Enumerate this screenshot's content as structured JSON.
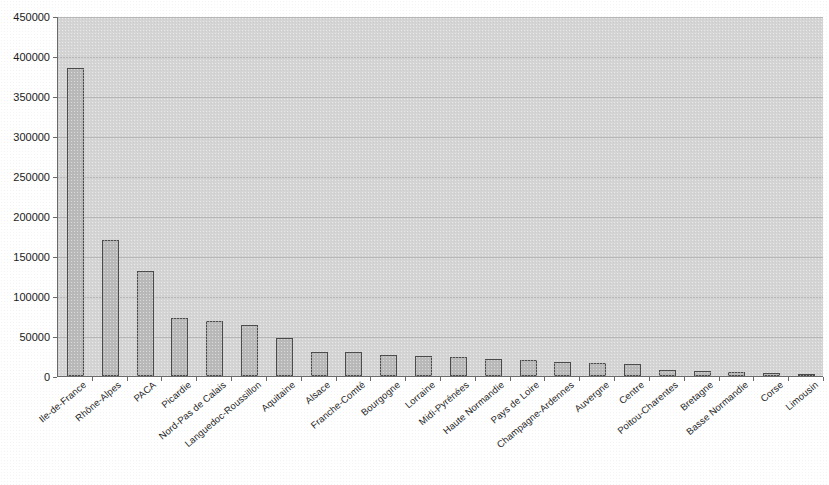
{
  "chart_data": {
    "type": "bar",
    "title": "",
    "subtitle": "",
    "xlabel": "",
    "ylabel": "",
    "ylim": [
      0,
      450000
    ],
    "ytick_step": 50000,
    "grid": true,
    "legend": false,
    "legend_position": "none",
    "orientation": "vertical",
    "bar_color": "#b9b9b9",
    "bar_edge_color": "#4a4a4a",
    "plot_background": "#d4d4d4",
    "page_background": "#ffffff",
    "ytick_labels": [
      "0",
      "50000",
      "100000",
      "150000",
      "200000",
      "250000",
      "300000",
      "350000",
      "400000",
      "450000"
    ],
    "ytick_values": [
      0,
      50000,
      100000,
      150000,
      200000,
      250000,
      300000,
      350000,
      400000,
      450000
    ],
    "categories": [
      "Ile-de-France",
      "Rhône-Alpes",
      "PACA",
      "Picardie",
      "Nord-Pas de Calais",
      "Languedoc-Roussillon",
      "Aquitaine",
      "Alsace",
      "Franche-Comté",
      "Bourgogne",
      "Lorraine",
      "Midi-Pyrénées",
      "Haute Normandie",
      "Pays de Loire",
      "Champagne-Ardennes",
      "Auvergne",
      "Centre",
      "Poitou-Charentes",
      "Bretagne",
      "Basse Normandie",
      "Corse",
      "Limousin"
    ],
    "values": [
      385000,
      170000,
      131000,
      73000,
      69000,
      64000,
      47000,
      30000,
      30000,
      26000,
      25000,
      24000,
      21000,
      20000,
      17500,
      16000,
      15000,
      8000,
      6000,
      5500,
      4000,
      2500
    ]
  }
}
